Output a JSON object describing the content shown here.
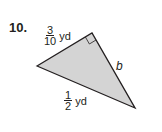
{
  "problem": {
    "number": "10.",
    "side_a": {
      "numerator": "3",
      "denominator": "10",
      "unit": "yd"
    },
    "side_b": {
      "label": "b"
    },
    "hypotenuse": {
      "numerator": "1",
      "denominator": "2",
      "unit": "yd"
    }
  },
  "colors": {
    "fill": "#d4d4d4",
    "stroke": "#231f20"
  }
}
